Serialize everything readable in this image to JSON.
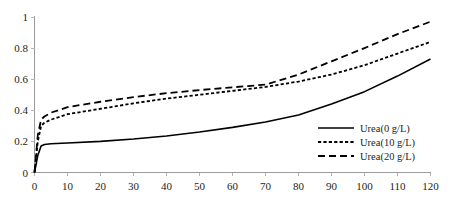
{
  "chart_data": {
    "type": "line",
    "title": "",
    "subtitle": "",
    "xlabel": "",
    "ylabel": "",
    "xlim": [
      0,
      120
    ],
    "ylim": [
      0,
      1
    ],
    "grid": false,
    "legend_position": "bottom-right",
    "x_ticks": [
      "0",
      "10",
      "20",
      "30",
      "40",
      "50",
      "60",
      "70",
      "80",
      "90",
      "100",
      "110",
      "120"
    ],
    "x_tick_values": [
      0,
      10,
      20,
      30,
      40,
      50,
      60,
      70,
      80,
      90,
      100,
      110,
      120
    ],
    "y_ticks": [
      "0",
      "0.2",
      "0.4",
      "0.6",
      "0.8",
      "1"
    ],
    "y_tick_values": [
      0,
      0.2,
      0.4,
      0.6,
      0.8,
      1
    ],
    "series": [
      {
        "name": "Urea(0 g/L)",
        "style": "solid",
        "color": "#000000",
        "x": [
          0,
          1,
          2,
          3,
          5,
          10,
          20,
          30,
          40,
          50,
          60,
          70,
          80,
          90,
          100,
          110,
          120
        ],
        "values": [
          0,
          0.11,
          0.17,
          0.18,
          0.185,
          0.19,
          0.2,
          0.215,
          0.235,
          0.26,
          0.29,
          0.325,
          0.37,
          0.44,
          0.52,
          0.62,
          0.73
        ]
      },
      {
        "name": "Urea(10 g/L)",
        "style": "dotted",
        "color": "#000000",
        "x": [
          0,
          1,
          2,
          3,
          5,
          10,
          20,
          30,
          40,
          50,
          60,
          70,
          80,
          90,
          100,
          110,
          120
        ],
        "values": [
          0,
          0.2,
          0.3,
          0.32,
          0.34,
          0.375,
          0.41,
          0.445,
          0.475,
          0.5,
          0.525,
          0.55,
          0.585,
          0.63,
          0.69,
          0.765,
          0.84
        ]
      },
      {
        "name": "Urea(20 g/L)",
        "style": "dashed",
        "color": "#000000",
        "x": [
          0,
          1,
          2,
          3,
          5,
          10,
          20,
          30,
          40,
          50,
          60,
          70,
          80,
          90,
          100,
          110,
          120
        ],
        "values": [
          0,
          0.24,
          0.34,
          0.36,
          0.385,
          0.42,
          0.455,
          0.485,
          0.51,
          0.53,
          0.548,
          0.565,
          0.63,
          0.715,
          0.8,
          0.89,
          0.97
        ]
      }
    ]
  },
  "legend": {
    "items": [
      {
        "label": "Urea(0 g/L)",
        "style": "solid"
      },
      {
        "label": "Urea(10 g/L)",
        "style": "dotted"
      },
      {
        "label": "Urea(20 g/L)",
        "style": "dashed"
      }
    ]
  }
}
